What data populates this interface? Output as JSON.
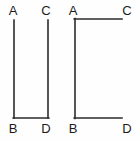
{
  "page": {
    "background_color": "#fefefe",
    "width": 140,
    "height": 141
  },
  "style": {
    "stroke_color": "#2b2b2b",
    "stroke_width": 1.6,
    "label_color": "#1c1c1c",
    "label_font_size": 13
  },
  "figures": [
    {
      "id": "left-figure",
      "shape_name": "u-shape-open-top",
      "description": "Open-top rectangle outline: two vertical segments joined by a bottom horizontal segment",
      "labels": {
        "top_left": "A",
        "top_right": "C",
        "bottom_left": "B",
        "bottom_right": "D"
      },
      "label_positions": {
        "top_left": {
          "x": 13,
          "y": 15
        },
        "top_right": {
          "x": 46,
          "y": 15
        },
        "bottom_left": {
          "x": 13,
          "y": 133
        },
        "bottom_right": {
          "x": 46,
          "y": 133
        }
      },
      "segments": [
        {
          "name": "left-vertical-AB",
          "x1": 14,
          "y1": 20,
          "x2": 14,
          "y2": 118
        },
        {
          "name": "right-vertical-CD",
          "x1": 48,
          "y1": 20,
          "x2": 48,
          "y2": 118
        },
        {
          "name": "bottom-horizontal-BD",
          "x1": 13,
          "y1": 118,
          "x2": 49,
          "y2": 118
        }
      ]
    },
    {
      "id": "right-figure",
      "shape_name": "c-bracket-open-right",
      "description": "Open-right bracket outline: one vertical segment on the left joined by top and bottom horizontal segments",
      "labels": {
        "top_left": "A",
        "top_right": "C",
        "bottom_left": "B",
        "bottom_right": "D"
      },
      "label_positions": {
        "top_left": {
          "x": 71,
          "y": 15
        },
        "top_right": {
          "x": 125,
          "y": 15
        },
        "bottom_left": {
          "x": 71,
          "y": 133
        },
        "bottom_right": {
          "x": 125,
          "y": 133
        }
      },
      "segments": [
        {
          "name": "left-vertical-AB",
          "x1": 75,
          "y1": 19,
          "x2": 75,
          "y2": 118
        },
        {
          "name": "top-horizontal-AC",
          "x1": 74,
          "y1": 19,
          "x2": 122,
          "y2": 19
        },
        {
          "name": "bottom-horizontal-BD",
          "x1": 74,
          "y1": 118,
          "x2": 122,
          "y2": 118
        }
      ]
    }
  ]
}
